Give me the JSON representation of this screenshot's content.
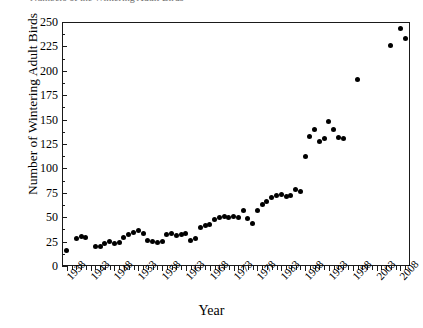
{
  "caption": {
    "clipped_text": "Numbers of the Wintering Adult Birds"
  },
  "axes": {
    "ylabel": "Number of Wintering Adult Birds",
    "xlabel": "Year",
    "y_ticks": [
      0,
      25,
      50,
      75,
      100,
      125,
      150,
      175,
      200,
      225,
      250
    ],
    "x_ticks": [
      1938,
      1943,
      1948,
      1953,
      1958,
      1963,
      1968,
      1973,
      1978,
      1983,
      1988,
      1993,
      1998,
      2003,
      2008
    ],
    "ylim": [
      0,
      250
    ],
    "xlim": [
      1937,
      2010
    ],
    "y_minor_step": 12.5,
    "x_minor_step": 1,
    "grid": false,
    "legend": "none",
    "marker_color": "#000000",
    "axis_color": "#1a1a1a"
  },
  "chart_data": {
    "type": "scatter",
    "title": "",
    "xlabel": "Year",
    "ylabel": "Number of Wintering Adult Birds",
    "xlim": [
      1937,
      2010
    ],
    "ylim": [
      0,
      250
    ],
    "grid": false,
    "legend_position": "none",
    "series": [
      {
        "name": "Wintering adult birds",
        "points": [
          [
            1938,
            16
          ],
          [
            1940,
            28
          ],
          [
            1941,
            30
          ],
          [
            1942,
            29
          ],
          [
            1944,
            20
          ],
          [
            1945,
            20
          ],
          [
            1946,
            23
          ],
          [
            1947,
            25
          ],
          [
            1948,
            23
          ],
          [
            1949,
            24
          ],
          [
            1950,
            29
          ],
          [
            1951,
            32
          ],
          [
            1952,
            34
          ],
          [
            1953,
            36
          ],
          [
            1954,
            33
          ],
          [
            1955,
            26
          ],
          [
            1956,
            25
          ],
          [
            1957,
            24
          ],
          [
            1958,
            25
          ],
          [
            1959,
            32
          ],
          [
            1960,
            33
          ],
          [
            1961,
            31
          ],
          [
            1962,
            32
          ],
          [
            1963,
            33
          ],
          [
            1964,
            26
          ],
          [
            1965,
            28
          ],
          [
            1966,
            39
          ],
          [
            1967,
            41
          ],
          [
            1968,
            43
          ],
          [
            1969,
            48
          ],
          [
            1970,
            50
          ],
          [
            1971,
            51
          ],
          [
            1972,
            50
          ],
          [
            1973,
            51
          ],
          [
            1974,
            50
          ],
          [
            1975,
            57
          ],
          [
            1976,
            49
          ],
          [
            1977,
            44
          ],
          [
            1978,
            57
          ],
          [
            1979,
            63
          ],
          [
            1980,
            66
          ],
          [
            1981,
            70
          ],
          [
            1982,
            72
          ],
          [
            1983,
            73
          ],
          [
            1984,
            71
          ],
          [
            1985,
            72
          ],
          [
            1986,
            78
          ],
          [
            1987,
            76
          ],
          [
            1988,
            112
          ],
          [
            1989,
            133
          ],
          [
            1990,
            140
          ],
          [
            1991,
            128
          ],
          [
            1992,
            131
          ],
          [
            1993,
            148
          ],
          [
            1994,
            140
          ],
          [
            1995,
            132
          ],
          [
            1996,
            131
          ],
          [
            1999,
            191
          ],
          [
            2006,
            226
          ],
          [
            2008,
            243
          ],
          [
            2009,
            233
          ]
        ]
      }
    ]
  }
}
